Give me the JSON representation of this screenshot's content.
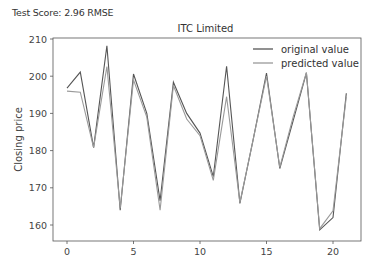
{
  "header": {
    "score_text": "Test Score: 2.96 RMSE"
  },
  "chart_data": {
    "type": "line",
    "title": "ITC Limited",
    "xlabel": "",
    "ylabel": "Closing price",
    "x": [
      0,
      1,
      2,
      3,
      4,
      5,
      6,
      7,
      8,
      9,
      10,
      11,
      12,
      13,
      14,
      15,
      16,
      17,
      18,
      19,
      20,
      21
    ],
    "xticks": [
      0,
      5,
      10,
      15,
      20
    ],
    "yticks": [
      160,
      170,
      180,
      190,
      200,
      210
    ],
    "xlim": [
      -1,
      22
    ],
    "ylim": [
      156,
      210.5
    ],
    "grid": false,
    "legend_position": "upper right",
    "series": [
      {
        "name": "original value",
        "color": "#555555",
        "values": [
          196.8,
          201.1,
          180.8,
          208.2,
          164.0,
          200.6,
          190.0,
          166.5,
          198.4,
          190.0,
          184.7,
          173.0,
          202.7,
          165.8,
          183.0,
          200.8,
          175.2,
          188.0,
          200.9,
          158.7,
          162.0,
          195.4
        ]
      },
      {
        "name": "predicted value",
        "color": "#9a9a9a",
        "values": [
          196.0,
          195.7,
          180.8,
          202.6,
          164.5,
          199.0,
          189.0,
          164.0,
          197.5,
          188.5,
          184.0,
          172.0,
          194.5,
          166.0,
          183.0,
          200.0,
          175.5,
          189.0,
          201.0,
          159.0,
          163.8,
          194.5
        ]
      }
    ]
  }
}
